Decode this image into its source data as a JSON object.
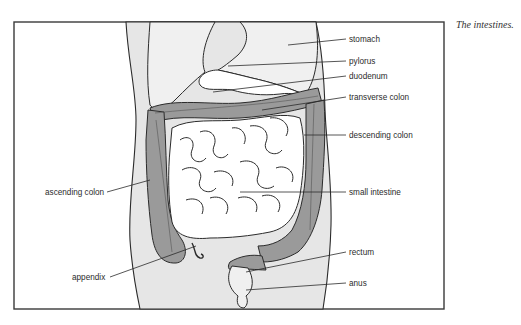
{
  "figure": {
    "caption": "The intestines.",
    "labels": {
      "stomach": "stomach",
      "pylorus": "pylorus",
      "duodenum": "duodenum",
      "transverse_colon": "transverse colon",
      "descending_colon": "descending colon",
      "ascending_colon": "ascending colon",
      "small_intestine": "small intestine",
      "appendix": "appendix",
      "rectum": "rectum",
      "anus": "anus"
    },
    "colors": {
      "body_fill": "#e6e6e6",
      "organ_fill": "#f0f0f0",
      "colon_fill": "#9a9a9a",
      "small_intestine_fill": "#ffffff",
      "outline": "#2b2b2b",
      "frame": "#3a3a3a"
    }
  }
}
